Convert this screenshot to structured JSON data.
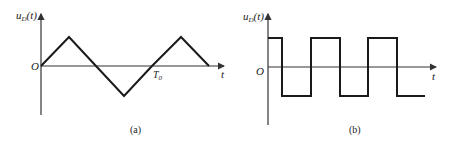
{
  "figure_a": {
    "caption": "(a)",
    "y_label": "u",
    "y_label_sub": "D",
    "y_label_arg": "(t)",
    "x_label": "t",
    "origin_label": "O",
    "period_label": "T",
    "period_label_sub": "0",
    "waveform": "triangle",
    "points": [
      [
        41,
        66
      ],
      [
        69,
        37
      ],
      [
        96,
        66
      ],
      [
        124,
        96
      ],
      [
        152,
        66
      ],
      [
        181,
        37
      ],
      [
        209,
        66
      ]
    ]
  },
  "figure_b": {
    "caption": "(b)",
    "y_label": "u",
    "y_label_sub": "D",
    "y_label_arg": "(t)",
    "x_label": "t",
    "origin_label": "O",
    "waveform": "square",
    "points": [
      [
        268,
        38
      ],
      [
        282,
        38
      ],
      [
        282,
        96
      ],
      [
        311,
        96
      ],
      [
        311,
        38
      ],
      [
        340,
        38
      ],
      [
        340,
        96
      ],
      [
        368,
        96
      ],
      [
        368,
        38
      ],
      [
        397,
        38
      ],
      [
        397,
        96
      ],
      [
        425,
        96
      ]
    ]
  },
  "colors": {
    "line": "#1a1a1a",
    "axis": "#333333"
  }
}
